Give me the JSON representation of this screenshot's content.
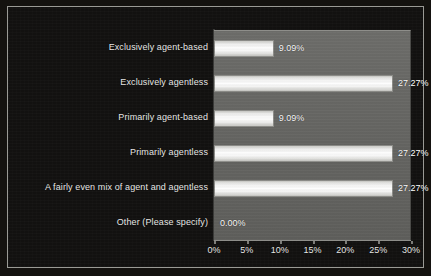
{
  "chart_data": {
    "type": "bar",
    "orientation": "horizontal",
    "title": "",
    "xlabel": "",
    "ylabel": "",
    "categories": [
      "Exclusively agent-based",
      "Exclusively agentless",
      "Primarily agent-based",
      "Primarily agentless",
      "A fairly even mix of agent and agentless",
      "Other (Please specify)"
    ],
    "values": [
      9.09,
      27.27,
      9.09,
      27.27,
      27.27,
      0.0
    ],
    "value_labels": [
      "9.09%",
      "27.27%",
      "9.09%",
      "27.27%",
      "27.27%",
      "0.00%"
    ],
    "xlim": [
      0,
      30
    ],
    "xticks": [
      0,
      5,
      10,
      15,
      20,
      25,
      30
    ],
    "xtick_labels": [
      "0%",
      "5%",
      "10%",
      "15%",
      "20%",
      "25%",
      "30%"
    ],
    "grid": false,
    "legend": false
  },
  "colors": {
    "outer_background": "#121110",
    "plot_background": "#666663",
    "bar_fill": "#fefefe",
    "bar_border": "#8d8d89",
    "text": "#e8e8e6",
    "frame_border": "#9a9a95"
  }
}
